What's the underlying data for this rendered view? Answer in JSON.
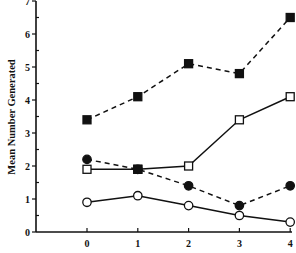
{
  "chart_data": {
    "type": "line",
    "title": "",
    "xlabel": "",
    "ylabel": "Mean Number Generated",
    "x": [
      0,
      1,
      2,
      3,
      4
    ],
    "x_tick_labels": [
      "0",
      "1",
      "2",
      "3",
      "4"
    ],
    "y_tick_labels": [
      "0",
      "1",
      "2",
      "3",
      "4",
      "5",
      "6",
      "7"
    ],
    "ylim": [
      0,
      7
    ],
    "grid": false,
    "legend": null,
    "series": [
      {
        "name": "filled squares (dashed)",
        "marker": "square-filled",
        "line": "dashed",
        "values": [
          3.4,
          4.1,
          5.1,
          4.8,
          6.5
        ]
      },
      {
        "name": "open squares (solid)",
        "marker": "square-open",
        "line": "solid",
        "values": [
          1.9,
          1.9,
          2.0,
          3.4,
          4.1
        ]
      },
      {
        "name": "filled circles (dashed)",
        "marker": "circle-filled",
        "line": "dashed",
        "values": [
          2.2,
          1.9,
          1.4,
          0.8,
          1.4
        ]
      },
      {
        "name": "open circles (solid)",
        "marker": "circle-open",
        "line": "solid",
        "values": [
          0.9,
          1.1,
          0.8,
          0.5,
          0.3
        ]
      }
    ]
  },
  "colors": {
    "ink": "#111111",
    "background": "#ffffff"
  }
}
